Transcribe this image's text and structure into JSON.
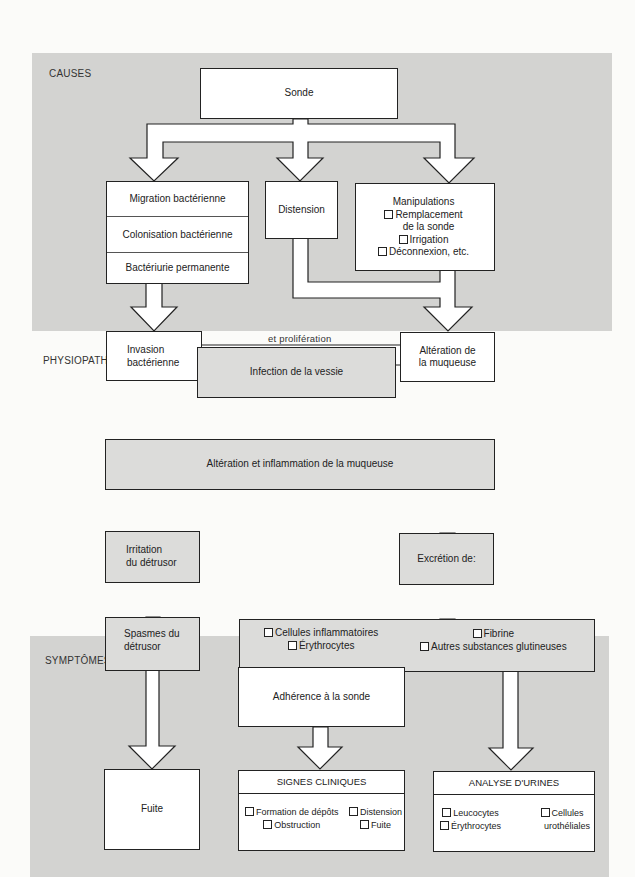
{
  "sections": {
    "causes": "CAUSES",
    "physio": "PHYSIOPATHOLOGIE",
    "symptoms": "SYMPTÔMES"
  },
  "colors": {
    "band": "#d3d3d1",
    "box_grey": "#dcdcda",
    "box_white": "#ffffff",
    "line": "#222222"
  },
  "nodes": {
    "sonde": "Sonde",
    "migration": "Migration bactérienne",
    "colonisation": "Colonisation bactérienne",
    "bacteriurie": "Bactériurie permanente",
    "distension": "Distension",
    "manipulations": {
      "title": "Manipulations",
      "items": [
        "Remplacement",
        "de la sonde",
        "Irrigation",
        "Déconnexion, etc."
      ]
    },
    "invasion": [
      "Invasion",
      "bactérienne"
    ],
    "proliferation": "et prolifération",
    "alteration_muqueuse": [
      "Altération de",
      "la muqueuse"
    ],
    "infection": "Infection de la vessie",
    "alteration_inflammation": "Altération et inflammation de la muqueuse",
    "irritation": [
      "Irritation",
      "du détrusor"
    ],
    "excretion": "Excrétion de:",
    "spasmes": [
      "Spasmes du",
      "détrusor"
    ],
    "excretion_items": {
      "col1": [
        "Cellules inflammatoires",
        "Érythrocytes"
      ],
      "col2": [
        "Fibrine",
        "Autres substances glutineuses"
      ]
    },
    "adherence": "Adhérence à la sonde",
    "fuite": "Fuite",
    "signes": {
      "title": "SIGNES CLINIQUES",
      "col1": [
        "Formation de dépôts",
        "Obstruction"
      ],
      "col2": [
        "Distension",
        "Fuite"
      ]
    },
    "analyse": {
      "title": "ANALYSE D'URINES",
      "col1": [
        "Leucocytes",
        "Érythrocytes"
      ],
      "col2": [
        "Cellules",
        "urothéliales"
      ]
    }
  }
}
